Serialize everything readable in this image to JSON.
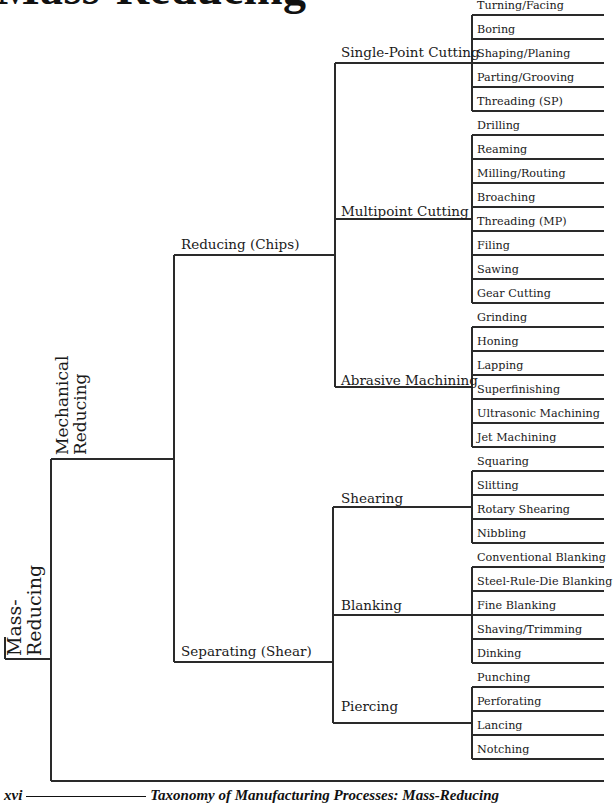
{
  "title": "Mass-Reducing",
  "root": {
    "label_line1": "Mass-",
    "label_line2": "Reducing"
  },
  "level1": {
    "label_line1": "Mechanical",
    "label_line2": "Reducing"
  },
  "level2": [
    {
      "label": "Reducing (Chips)"
    },
    {
      "label": "Separating (Shear)"
    }
  ],
  "groups": [
    {
      "label": "Single-Point Cutting",
      "items": [
        "Turning/Facing",
        "Boring",
        "Shaping/Planing",
        "Parting/Grooving",
        "Threading (SP)"
      ]
    },
    {
      "label": "Multipoint Cutting",
      "items": [
        "Drilling",
        "Reaming",
        "Milling/Routing",
        "Broaching",
        "Threading (MP)",
        "Filing",
        "Sawing",
        "Gear Cutting"
      ]
    },
    {
      "label": "Abrasive Machining",
      "items": [
        "Grinding",
        "Honing",
        "Lapping",
        "Superfinishing",
        "Ultrasonic Machining",
        "Jet Machining"
      ]
    },
    {
      "label": "Shearing",
      "items": [
        "Squaring",
        "Slitting",
        "Rotary Shearing",
        "Nibbling"
      ]
    },
    {
      "label": "Blanking",
      "items": [
        "Conventional Blanking",
        "Steel-Rule-Die Blanking",
        "Fine Blanking",
        "Shaving/Trimming",
        "Dinking"
      ]
    },
    {
      "label": "Piercing",
      "items": [
        "Punching",
        "Perforating",
        "Lancing",
        "Notching"
      ]
    }
  ],
  "footer": {
    "page_number": "xvi",
    "caption": "Taxonomy of Manufacturing Processes: Mass-Reducing"
  },
  "colors": {
    "ink": "#1a1a1a",
    "background": "#ffffff"
  }
}
